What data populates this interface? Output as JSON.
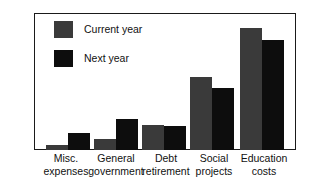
{
  "chart_data": {
    "type": "bar",
    "title": "",
    "subtitle": "",
    "xlabel": "",
    "ylabel": "",
    "grid": false,
    "legend_position": "top-left",
    "ylim": [
      0,
      54
    ],
    "yticks": [
      10,
      20,
      30,
      40,
      50
    ],
    "ytick_labels": [
      "10",
      "20",
      "30",
      "40",
      "50"
    ],
    "yminor_ticks": [
      5,
      15,
      25,
      35,
      45
    ],
    "categories": [
      "Misc. expenses",
      "General government",
      "Debt retirement",
      "Social projects",
      "Education costs"
    ],
    "category_lines": [
      [
        "Misc.",
        "expenses"
      ],
      [
        "General",
        "government"
      ],
      [
        "Debt",
        "retirement"
      ],
      [
        "Social",
        "projects"
      ],
      [
        "Education",
        "costs"
      ]
    ],
    "series": [
      {
        "name": "Current year",
        "color": "#3a3a3a",
        "values": [
          2,
          4.5,
          10,
          29.5,
          49
        ]
      },
      {
        "name": "Next year",
        "color": "#0d0d0d",
        "values": [
          7,
          12.5,
          9.8,
          25,
          44.5
        ]
      }
    ]
  },
  "legend": {
    "items": [
      {
        "label": "Current year",
        "color": "#3a3a3a"
      },
      {
        "label": "Next year",
        "color": "#0d0d0d"
      }
    ]
  },
  "axis": {
    "y_labels": [
      "50",
      "40",
      "30",
      "20",
      "10"
    ]
  },
  "colors": {
    "frame": "#1a1a1a",
    "background": "#ffffff",
    "text": "#111111",
    "current_year": "#3a3a3a",
    "next_year": "#0d0d0d"
  }
}
